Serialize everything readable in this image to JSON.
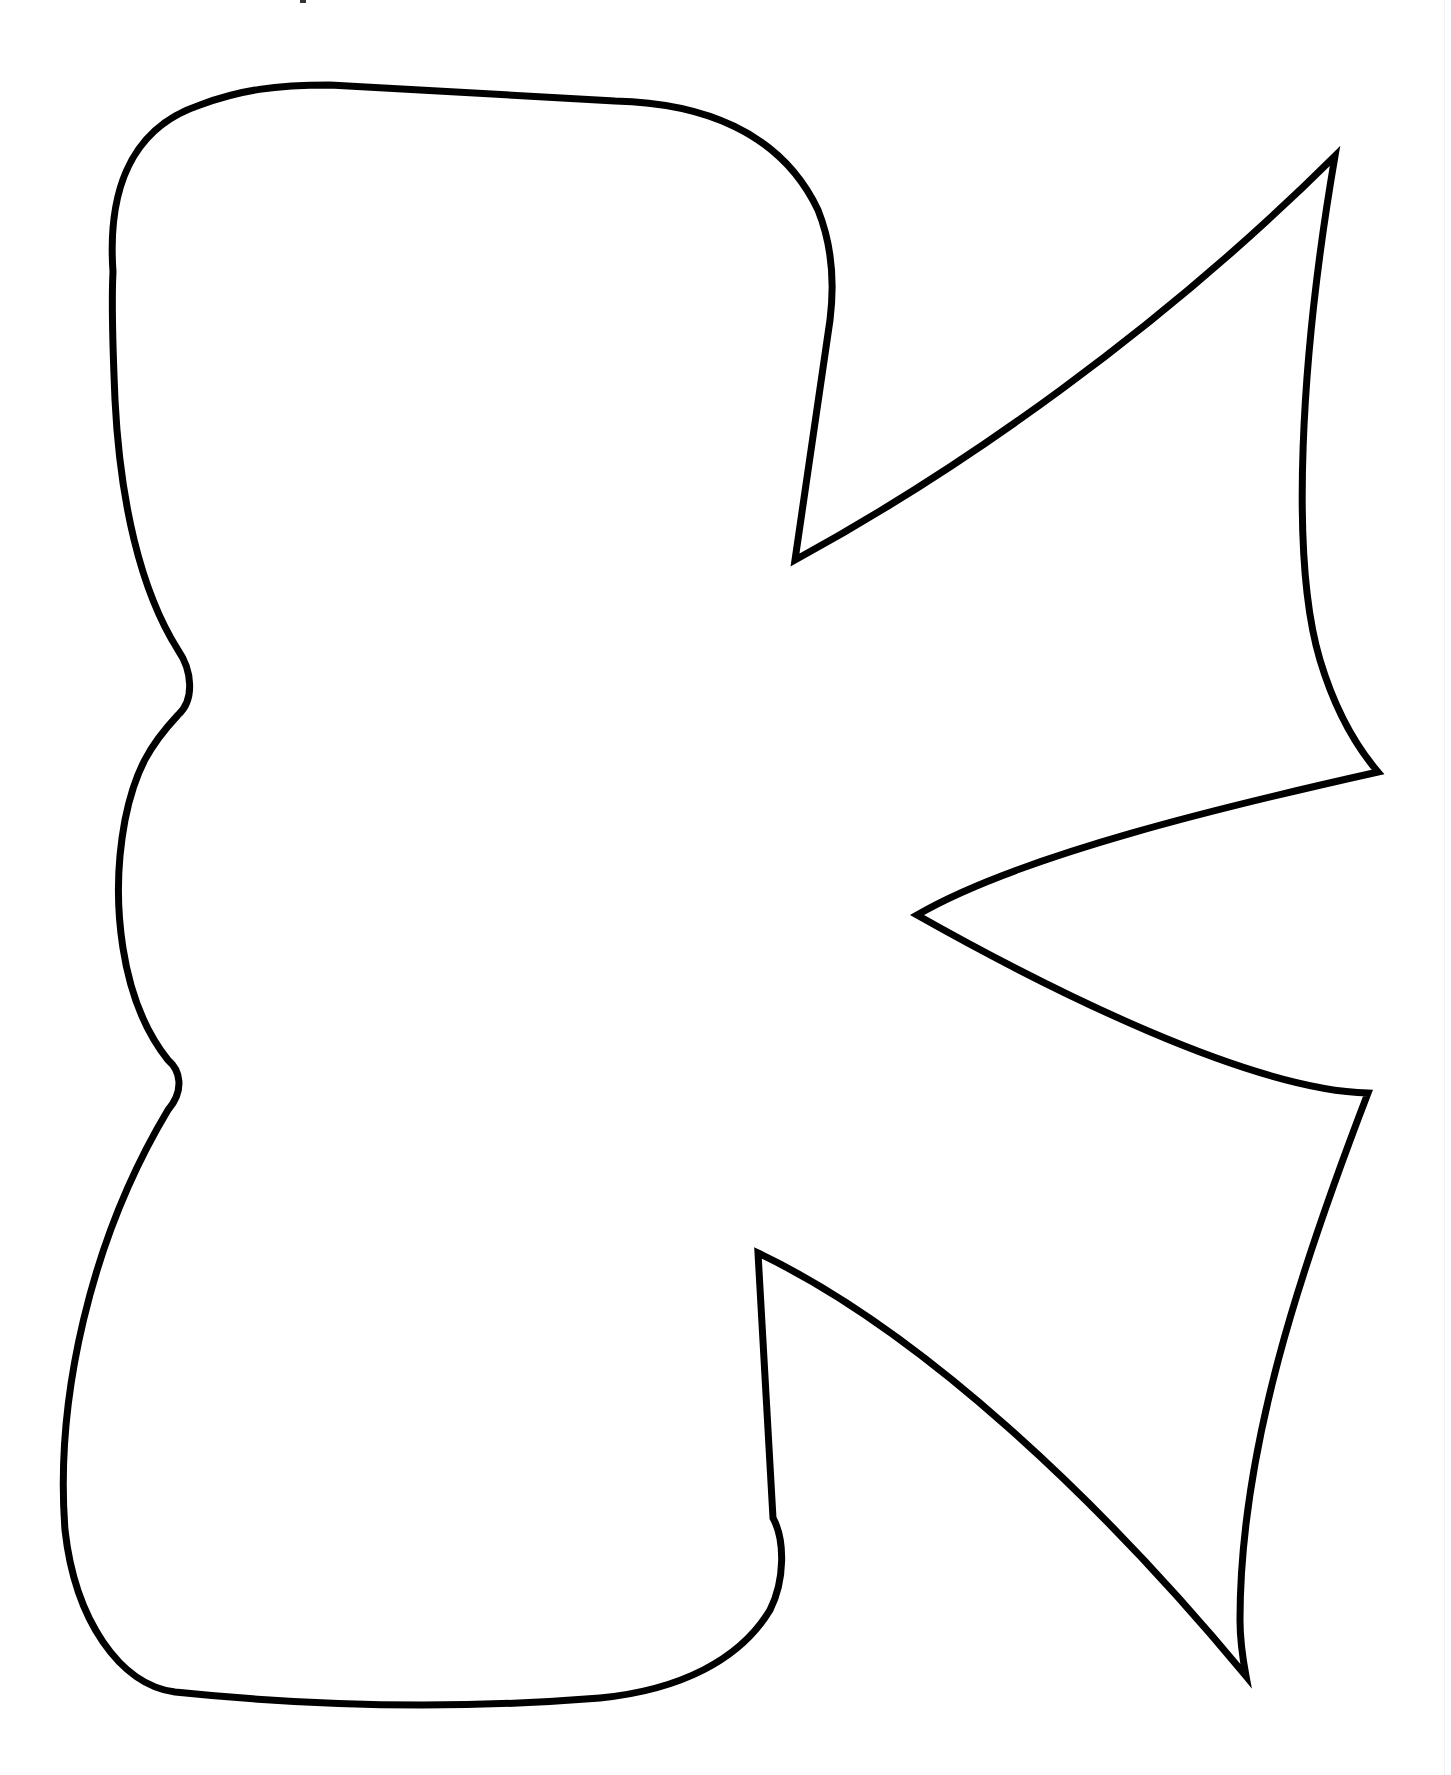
{
  "page": {
    "type": "coloring-page",
    "letter": "K",
    "background_color": "#ffffff",
    "stroke_color": "#000000",
    "stroke_width": 7
  }
}
